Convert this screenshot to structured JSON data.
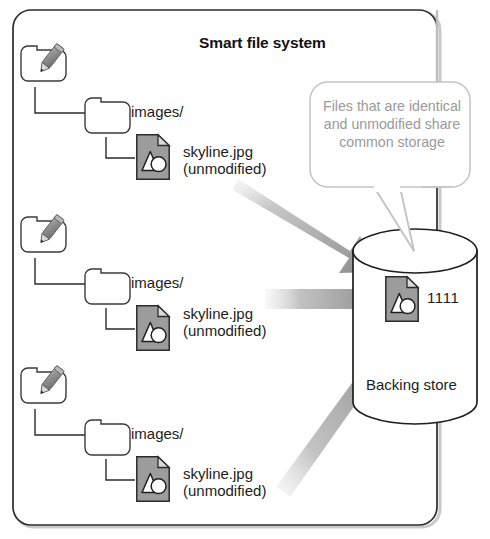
{
  "diagram": {
    "title": "Smart file system",
    "callout": {
      "text": "Files that are identical and unmodified share common storage",
      "color": "#9a9a9a"
    },
    "backing_store": {
      "label": "Backing store",
      "hash": "1111"
    },
    "branches": [
      {
        "root_icon": "smart-folder-pencil-icon",
        "folder": "images/",
        "file_name": "skyline.jpg",
        "file_state": "(unmodified)"
      },
      {
        "root_icon": "smart-folder-pencil-icon",
        "folder": "images/",
        "file_name": "skyline.jpg",
        "file_state": "(unmodified)"
      },
      {
        "root_icon": "smart-folder-pencil-icon",
        "folder": "images/",
        "file_name": "skyline.jpg",
        "file_state": "(unmodified)"
      }
    ],
    "arrows": [
      {
        "name": "dedup-arrow-top"
      },
      {
        "name": "dedup-arrow-middle"
      },
      {
        "name": "dedup-arrow-bottom"
      }
    ],
    "colors": {
      "outline": "#222222",
      "file_fill": "#9c9c9c",
      "arrow_dark": "#8b8b8b",
      "callout_outline": "#bdbdbd"
    }
  }
}
